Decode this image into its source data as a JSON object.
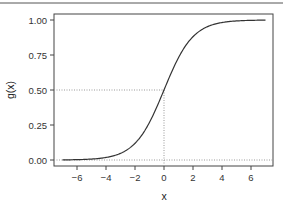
{
  "chart_data": {
    "type": "line",
    "title": "",
    "xlabel": "x",
    "ylabel": "g(x)",
    "xlim": [
      -7,
      7
    ],
    "ylim": [
      0,
      1
    ],
    "x_ticks": [
      -6,
      -4,
      -2,
      0,
      2,
      4,
      6
    ],
    "x_tick_labels": [
      "−6",
      "−4",
      "−2",
      "0",
      "2",
      "4",
      "6"
    ],
    "y_ticks": [
      0,
      0.25,
      0.5,
      0.75,
      1
    ],
    "y_tick_labels": [
      "0.00",
      "0.25",
      "0.50",
      "0.75",
      "1.00"
    ],
    "grid": false,
    "legend": null,
    "series": [
      {
        "name": "logistic sigmoid g(x) = 1/(1+e^-x)",
        "x": [
          -7,
          -6,
          -5,
          -4,
          -3,
          -2,
          -1,
          0,
          1,
          2,
          3,
          4,
          5,
          6,
          7
        ],
        "values": [
          0.001,
          0.002,
          0.007,
          0.018,
          0.047,
          0.119,
          0.269,
          0.5,
          0.731,
          0.881,
          0.953,
          0.982,
          0.993,
          0.998,
          0.999
        ]
      }
    ],
    "reference_lines": [
      {
        "type": "horizontal",
        "y": 0.5,
        "style": "dotted",
        "from_x": "axis-left",
        "to_x": 0
      },
      {
        "type": "vertical",
        "x": 0,
        "style": "dotted",
        "from_y": "axis-bottom",
        "to_y": 0.5
      },
      {
        "type": "horizontal",
        "y": 0.0,
        "style": "dotted",
        "from_x": "axis-left",
        "to_x": "axis-right"
      }
    ],
    "colors": {
      "curve": "#333333",
      "frame": "#444444",
      "reference": "#999999"
    }
  }
}
